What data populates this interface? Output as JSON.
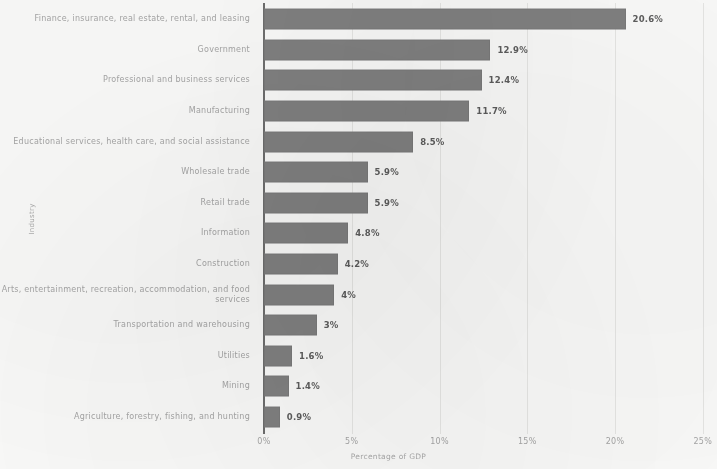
{
  "chart_data": {
    "type": "bar",
    "orientation": "horizontal",
    "title": "",
    "xlabel": "Percentage of GDP",
    "ylabel": "Industry",
    "xlim": [
      0,
      25
    ],
    "xticks": [
      "0%",
      "5%",
      "10%",
      "15%",
      "20%",
      "25%"
    ],
    "xtick_values": [
      0,
      5,
      10,
      15,
      20,
      25
    ],
    "grid": true,
    "legend": "none",
    "bar_color": "#818181",
    "categories": [
      "Finance, insurance, real estate, rental, and leasing",
      "Government",
      "Professional and business services",
      "Manufacturing",
      "Educational services, health care, and social assistance",
      "Wholesale trade",
      "Retail trade",
      "Information",
      "Construction",
      "Arts, entertainment, recreation, accommodation, and food services",
      "Transportation and warehousing",
      "Utilities",
      "Mining",
      "Agriculture, forestry, fishing, and hunting"
    ],
    "values": [
      20.6,
      12.9,
      12.4,
      11.7,
      8.5,
      5.9,
      5.9,
      4.8,
      4.2,
      4,
      3,
      1.6,
      1.4,
      0.9
    ],
    "data_labels": [
      "20.6%",
      "12.9%",
      "12.4%",
      "11.7%",
      "8.5%",
      "5.9%",
      "5.9%",
      "4.8%",
      "4.2%",
      "4%",
      "3%",
      "1.6%",
      "1.4%",
      "0.9%"
    ]
  }
}
